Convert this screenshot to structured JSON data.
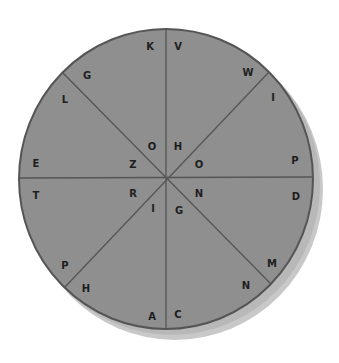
{
  "diagram": {
    "type": "letter-wheel",
    "center": [
      166,
      179
    ],
    "radius": 148,
    "colors": {
      "fill": "#8f8f8f",
      "stroke": "#555555",
      "shadow": "#c4c4c4",
      "text": "#1e1e1e"
    },
    "segments": 8,
    "outer_letters": [
      {
        "id": "k",
        "text": "K",
        "x": 150,
        "y": 46
      },
      {
        "id": "v",
        "text": "V",
        "x": 178,
        "y": 46
      },
      {
        "id": "w",
        "text": "W",
        "x": 248,
        "y": 72
      },
      {
        "id": "i1",
        "text": "I",
        "x": 273,
        "y": 97
      },
      {
        "id": "p1",
        "text": "P",
        "x": 295,
        "y": 160
      },
      {
        "id": "d",
        "text": "D",
        "x": 296,
        "y": 196
      },
      {
        "id": "m",
        "text": "M",
        "x": 272,
        "y": 263
      },
      {
        "id": "n2",
        "text": "N",
        "x": 246,
        "y": 285
      },
      {
        "id": "c",
        "text": "C",
        "x": 178,
        "y": 314
      },
      {
        "id": "a",
        "text": "A",
        "x": 152,
        "y": 316
      },
      {
        "id": "h2",
        "text": "H",
        "x": 86,
        "y": 288
      },
      {
        "id": "p2",
        "text": "P",
        "x": 65,
        "y": 265
      },
      {
        "id": "t",
        "text": "T",
        "x": 36,
        "y": 195
      },
      {
        "id": "e",
        "text": "E",
        "x": 36,
        "y": 163
      },
      {
        "id": "l",
        "text": "L",
        "x": 65,
        "y": 99
      },
      {
        "id": "g1",
        "text": "G",
        "x": 87,
        "y": 75
      }
    ],
    "inner_letters": [
      {
        "id": "o1",
        "text": "O",
        "x": 152,
        "y": 146
      },
      {
        "id": "h1",
        "text": "H",
        "x": 178,
        "y": 146
      },
      {
        "id": "o2",
        "text": "O",
        "x": 199,
        "y": 164
      },
      {
        "id": "n1",
        "text": "N",
        "x": 199,
        "y": 193
      },
      {
        "id": "g2",
        "text": "G",
        "x": 179,
        "y": 210
      },
      {
        "id": "i2",
        "text": "I",
        "x": 153,
        "y": 208
      },
      {
        "id": "r",
        "text": "R",
        "x": 133,
        "y": 193
      },
      {
        "id": "z",
        "text": "Z",
        "x": 133,
        "y": 164
      }
    ]
  }
}
